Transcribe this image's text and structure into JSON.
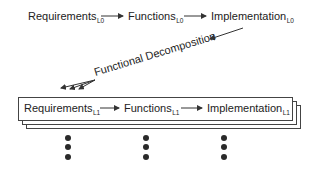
{
  "diagram": {
    "level0": {
      "requirements": {
        "label": "Requirements",
        "subscript": "L0"
      },
      "functions": {
        "label": "Functions",
        "subscript": "L0"
      },
      "implementation": {
        "label": "Implementation",
        "subscript": "L0"
      }
    },
    "decomposition": {
      "label": "Functional Decomposition"
    },
    "level1": {
      "requirements": {
        "label": "Requirements",
        "subscript": "L1"
      },
      "functions": {
        "label": "Functions",
        "subscript": "L1"
      },
      "implementation": {
        "label": "Implementation",
        "subscript": "L1"
      }
    },
    "continuation": {
      "symbol": "ellipsis-vertical",
      "columns": 3,
      "dots_per_column": 3
    },
    "colors": {
      "stroke": "#333333",
      "text": "#222222",
      "background": "#ffffff"
    }
  }
}
